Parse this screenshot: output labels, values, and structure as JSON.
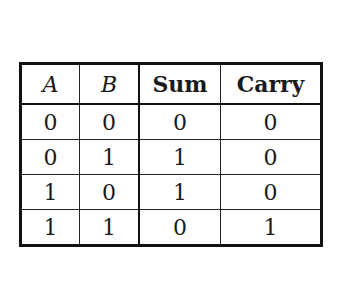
{
  "table": {
    "headers": [
      "A",
      "B",
      "Sum",
      "Carry"
    ],
    "rows": [
      [
        "0",
        "0",
        "0",
        "0"
      ],
      [
        "0",
        "1",
        "1",
        "0"
      ],
      [
        "1",
        "0",
        "1",
        "0"
      ],
      [
        "1",
        "1",
        "0",
        "1"
      ]
    ]
  }
}
